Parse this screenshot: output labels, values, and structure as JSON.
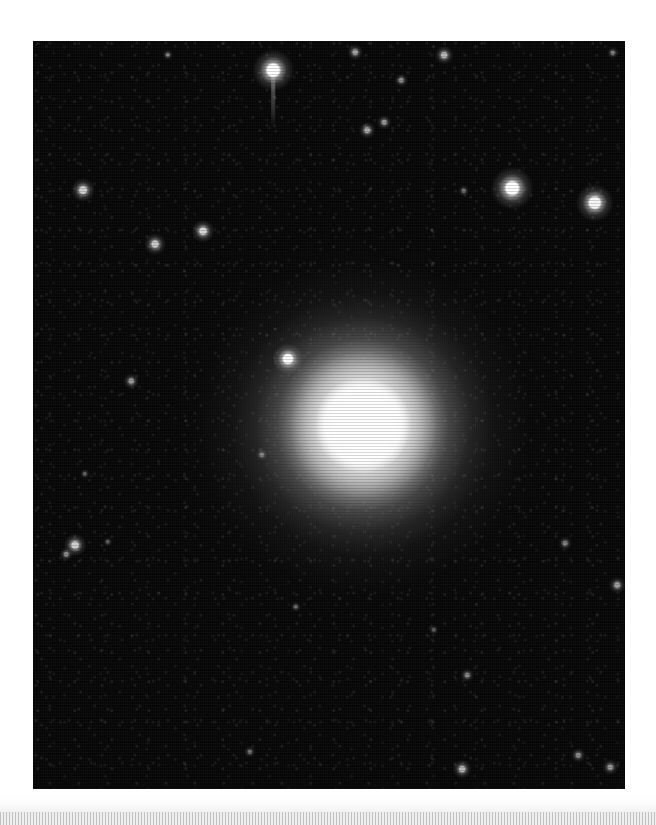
{
  "document": {
    "title": "Astronomical Plate Image",
    "background_color": "#ffffff",
    "width": 656,
    "height": 825
  },
  "plate": {
    "name": "astronomical-image-plate",
    "caption": "",
    "x": 33,
    "y": 41,
    "width": 592,
    "height": 748,
    "background_color": "#050505",
    "sky_background_color": "#060606",
    "border_color": "#000000"
  },
  "galaxy": {
    "name": "elliptical-galaxy",
    "center_x": 363,
    "center_y": 425,
    "core_radius": 48,
    "inner_halo_radius": 86,
    "mid_halo_radius": 132,
    "outer_halo_radius": 196,
    "core_color": "#ffffff",
    "halo_color": "#b4b4b4"
  },
  "stars": [
    {
      "label": "star-01",
      "x": 273,
      "y": 70,
      "r": 8.0,
      "brightness": 1.0,
      "bleed": true
    },
    {
      "label": "star-02",
      "x": 355,
      "y": 52,
      "r": 3.0,
      "brightness": 0.62,
      "bleed": false
    },
    {
      "label": "star-03",
      "x": 444,
      "y": 55,
      "r": 3.6,
      "brightness": 0.7,
      "bleed": false
    },
    {
      "label": "star-04",
      "x": 168,
      "y": 55,
      "r": 2.2,
      "brightness": 0.45,
      "bleed": false
    },
    {
      "label": "star-05",
      "x": 401,
      "y": 80,
      "r": 2.6,
      "brightness": 0.52,
      "bleed": false
    },
    {
      "label": "star-06",
      "x": 613,
      "y": 53,
      "r": 2.4,
      "brightness": 0.48,
      "bleed": false
    },
    {
      "label": "star-07",
      "x": 367,
      "y": 130,
      "r": 3.2,
      "brightness": 0.64,
      "bleed": false
    },
    {
      "label": "star-08",
      "x": 384,
      "y": 122,
      "r": 2.8,
      "brightness": 0.56,
      "bleed": false
    },
    {
      "label": "star-09",
      "x": 512,
      "y": 188,
      "r": 8.2,
      "brightness": 1.0,
      "bleed": false
    },
    {
      "label": "star-10",
      "x": 595,
      "y": 203,
      "r": 7.4,
      "brightness": 0.96,
      "bleed": false
    },
    {
      "label": "star-11",
      "x": 464,
      "y": 191,
      "r": 2.4,
      "brightness": 0.4,
      "bleed": false
    },
    {
      "label": "star-12",
      "x": 83,
      "y": 190,
      "r": 4.6,
      "brightness": 0.8,
      "bleed": false
    },
    {
      "label": "star-13",
      "x": 155,
      "y": 244,
      "r": 4.2,
      "brightness": 0.78,
      "bleed": false
    },
    {
      "label": "star-14",
      "x": 203,
      "y": 231,
      "r": 4.4,
      "brightness": 0.82,
      "bleed": false
    },
    {
      "label": "star-15",
      "x": 131,
      "y": 381,
      "r": 3.0,
      "brightness": 0.58,
      "bleed": false
    },
    {
      "label": "star-16",
      "x": 288,
      "y": 359,
      "r": 6.0,
      "brightness": 0.98,
      "bleed": false
    },
    {
      "label": "star-17",
      "x": 262,
      "y": 455,
      "r": 2.4,
      "brightness": 0.44,
      "bleed": false
    },
    {
      "label": "star-18",
      "x": 85,
      "y": 474,
      "r": 2.0,
      "brightness": 0.38,
      "bleed": false
    },
    {
      "label": "star-19",
      "x": 75,
      "y": 545,
      "r": 4.4,
      "brightness": 0.8,
      "bleed": false
    },
    {
      "label": "star-20",
      "x": 66,
      "y": 554,
      "r": 2.6,
      "brightness": 0.52,
      "bleed": false
    },
    {
      "label": "star-21",
      "x": 565,
      "y": 543,
      "r": 2.6,
      "brightness": 0.48,
      "bleed": false
    },
    {
      "label": "star-22",
      "x": 617,
      "y": 585,
      "r": 3.2,
      "brightness": 0.6,
      "bleed": false
    },
    {
      "label": "star-23",
      "x": 578,
      "y": 755,
      "r": 2.8,
      "brightness": 0.52,
      "bleed": false
    },
    {
      "label": "star-24",
      "x": 610,
      "y": 767,
      "r": 3.0,
      "brightness": 0.56,
      "bleed": false
    },
    {
      "label": "star-25",
      "x": 462,
      "y": 769,
      "r": 3.6,
      "brightness": 0.7,
      "bleed": false
    },
    {
      "label": "star-26",
      "x": 250,
      "y": 752,
      "r": 2.4,
      "brightness": 0.42,
      "bleed": false
    },
    {
      "label": "star-27",
      "x": 296,
      "y": 607,
      "r": 2.2,
      "brightness": 0.4,
      "bleed": false
    },
    {
      "label": "star-28",
      "x": 467,
      "y": 675,
      "r": 2.6,
      "brightness": 0.5,
      "bleed": false
    },
    {
      "label": "star-29",
      "x": 434,
      "y": 630,
      "r": 2.0,
      "brightness": 0.36,
      "bleed": false
    },
    {
      "label": "star-30",
      "x": 108,
      "y": 542,
      "r": 2.0,
      "brightness": 0.36,
      "bleed": false
    }
  ],
  "bottom_strip": {
    "name": "bottom-texture-strip",
    "x": 0,
    "y": 812,
    "width": 656,
    "height": 13,
    "color": "#e0e0e0",
    "fade_y": 795,
    "fade_height": 17
  }
}
